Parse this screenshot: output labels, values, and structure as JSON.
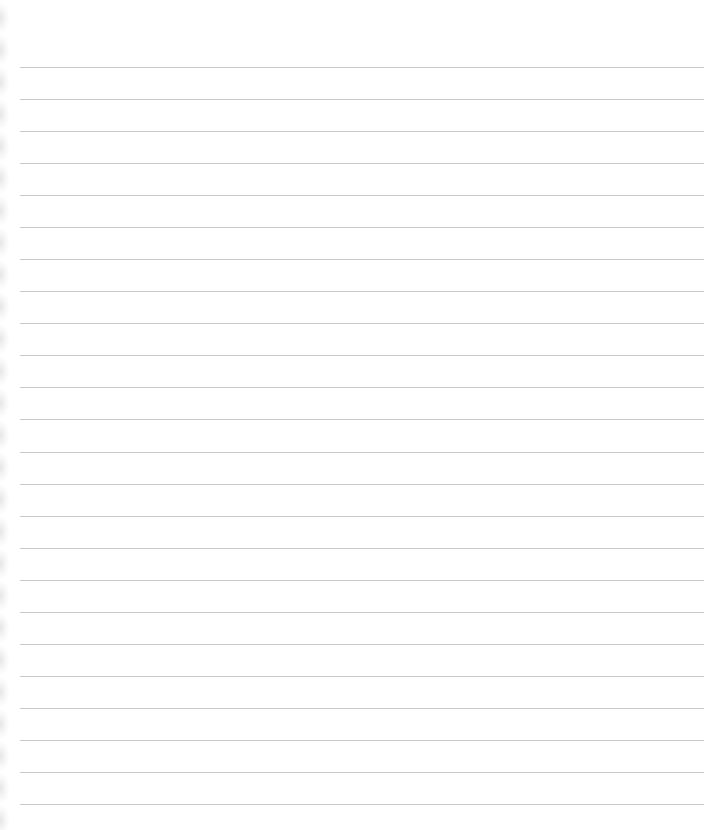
{
  "page": {
    "type": "lined-notebook-paper",
    "background_color": "#ffffff",
    "rule_color": "#c8c8c8",
    "rule_count": 24,
    "first_rule_y": 67,
    "rule_spacing_px": 32,
    "rule_left_x": 20,
    "rule_right_x": 704,
    "left_edge": "perforated-torn"
  }
}
